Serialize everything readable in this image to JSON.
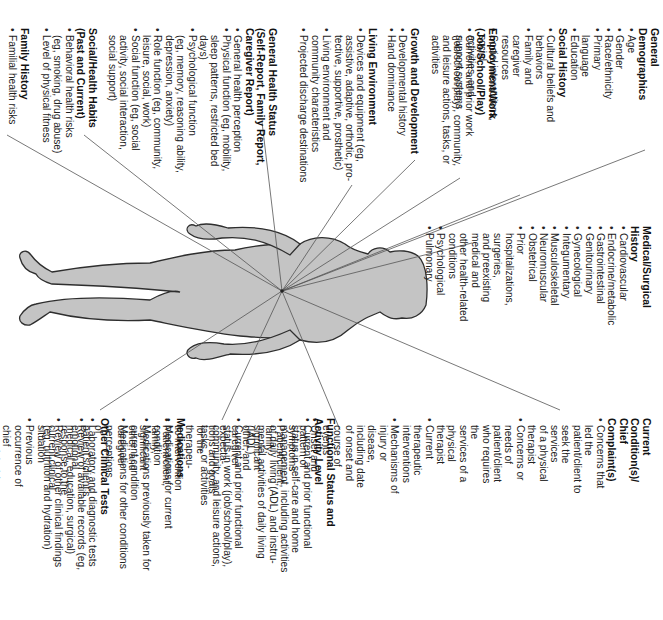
{
  "diagram": {
    "orientation": "rotated-90-clockwise",
    "figure": "human-body-silhouette",
    "colors": {
      "body_fill": "#c4c4c4",
      "body_stroke": "#333333",
      "ray": "#555555",
      "text": "#222222"
    },
    "sections": {
      "general_demographics": {
        "title": "General Demographics",
        "items": [
          "Age",
          "Gender",
          "Race/ethnicity",
          "Primary language",
          "Education"
        ]
      },
      "social_history": {
        "title": "Social History",
        "items": [
          "Cultural beliefs and behaviors",
          "Family and caregiver resources",
          "Social interactions, social\n   activities, and support systems"
        ]
      },
      "employment_work": {
        "title": "Employment/Work\n(Job/School/Play)",
        "items": [
          "Current and prior work\n   (job/school/play), community,\n   and leisure actions, tasks, or\n   activities"
        ]
      },
      "growth_development": {
        "title": "Growth and Development",
        "items": [
          "Developmental history",
          "Hand dominance"
        ]
      },
      "living_environment": {
        "title": "Living Environment",
        "items": [
          "Devices and equipment (eg,\n   assistive, adaptive, orthotic, pro-\n   tective, supportive, prosthetic)",
          "Living environment and\n   community characteristics",
          "Projected discharge destinations"
        ]
      },
      "general_health_status": {
        "title": "General Health Status\n(Self-Report, Family Report,\nCaregiver Report)",
        "items": [
          "General health perception",
          "Physical function (eg, mobility,\n   sleep patterns, restricted bed\n   days)",
          "Psychological function\n   (eg, memory, reasoning ability,\n   depression, anxiety)",
          "Role function (eg, community,\n   leisure, social, work)",
          "Social function (eg, social\n   activity, social interaction,\n   social support)"
        ]
      },
      "social_health_habits": {
        "title": "Social/Health Habits\n(Past and Current)",
        "items": [
          "Behavioral health risks\n   (eg, smoking, drug abuse)",
          "Level of physical fitness"
        ]
      },
      "family_history": {
        "title": "Family History",
        "items": [
          "Familial health risks"
        ]
      },
      "medical_surgical_history": {
        "title": "Medical/Surgical History",
        "items": [
          "Cardiovascular",
          "Endocrine/metabolic",
          "Gastrointestinal",
          "Genitourinary",
          "Gynecological",
          "Integumentary",
          "Musculoskeletal",
          "Neuromuscular",
          "Obstetrical",
          "Prior hospitalizations, surgeries,\n   and preexisting medical and\n   other health-related conditions",
          "Psychological",
          "Pulmonary"
        ]
      },
      "current_conditions": {
        "title": "Current Condition(s)/\nChief Complaint(s)",
        "items": [
          "Concerns that led the\n   patient/client to seek the services\n   of a physical therapist",
          "Concerns or needs of\n   patient/client who requires the\n   services of a physical therapist",
          "Current therapeutic\n   interventions",
          "Mechanisms of injury or disease,\n   including date of onset and\n   course of events",
          "Onset and pattern of symptoms",
          "Patient/client, family, significant\n   other, and caregiver expecta-\n   tions and goals for the therapeu-\n   tic intervention",
          "Patient/client, family, significant\n   other, and caregiver perceptions\n   of patient's/client's emotional\n   response to the current clinical\n   situation",
          "Previous occurrence of chief\n   complaint(s)",
          "Prior therapeutic interventions"
        ]
      },
      "functional_status": {
        "title": "Functional Status and\nActivity Level",
        "items": [
          "Current and prior functional\n   status in self-care and home\n   management, including activities\n   of daily living (ADL) and instru-\n   mental activities of daily living\n   (IADL)",
          "Current and prior functional\n   status in work (job/school/play),\n   community, and leisure actions,\n   tasks, or activities"
        ]
      },
      "medications": {
        "title": "Medications",
        "items": [
          "Medications for current\n   condition",
          "Medications previously taken for\n   current condition",
          "Medications for other conditions"
        ]
      },
      "other_clinical_tests": {
        "title": "Other Clinical Tests",
        "items": [
          "Laboratory and diagnostic tests",
          "Review of available records (eg,\n   medical, education, surgical)",
          "Review of other clinical findings\n   (eg, nutrition and hydration)"
        ]
      }
    }
  }
}
